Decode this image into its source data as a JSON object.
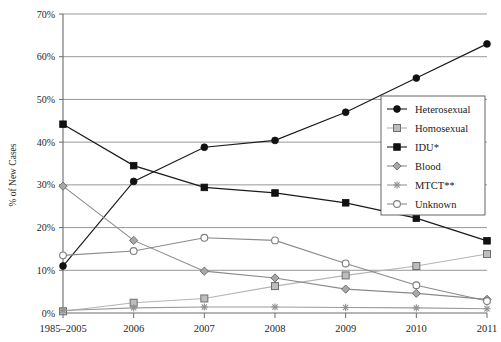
{
  "chart_data": {
    "type": "line",
    "title": "",
    "xlabel": "",
    "ylabel": "% of New Cases",
    "categories": [
      "1985–2005",
      "2006",
      "2007",
      "2008",
      "2009",
      "2010",
      "2011"
    ],
    "ylim": [
      0,
      70
    ],
    "ytick_labels": [
      "0%",
      "10%",
      "20%",
      "30%",
      "40%",
      "50%",
      "60%",
      "70%"
    ],
    "ytick_values": [
      0,
      10,
      20,
      30,
      40,
      50,
      60,
      70
    ],
    "grid": true,
    "legend_position": "right-middle",
    "series": [
      {
        "name": "Heterosexual",
        "marker": "filled-circle",
        "color": "#1a1a1a",
        "values": [
          11.0,
          30.8,
          38.8,
          40.4,
          47.0,
          55.0,
          63.0
        ]
      },
      {
        "name": "Homosexual",
        "marker": "light-square",
        "color": "#b5b5b5",
        "values": [
          0.4,
          2.4,
          3.4,
          6.3,
          8.8,
          11.0,
          13.8
        ]
      },
      {
        "name": "IDU*",
        "marker": "filled-square",
        "color": "#1a1a1a",
        "values": [
          44.2,
          34.5,
          29.4,
          28.1,
          25.8,
          22.2,
          16.9
        ]
      },
      {
        "name": "Blood",
        "marker": "diamond",
        "color": "#8a8a8a",
        "values": [
          29.7,
          17.0,
          9.8,
          8.2,
          5.6,
          4.6,
          3.2
        ]
      },
      {
        "name": "MTCT**",
        "marker": "asterisk",
        "color": "#9a9a9a",
        "values": [
          0.6,
          1.2,
          1.4,
          1.4,
          1.3,
          1.2,
          1.0
        ]
      },
      {
        "name": "Unknown",
        "marker": "open-circle",
        "color": "#8a8a8a",
        "values": [
          13.5,
          14.5,
          17.6,
          17.0,
          11.6,
          6.5,
          2.8
        ]
      }
    ]
  },
  "axis": {
    "y_title": "% of New Cases"
  }
}
